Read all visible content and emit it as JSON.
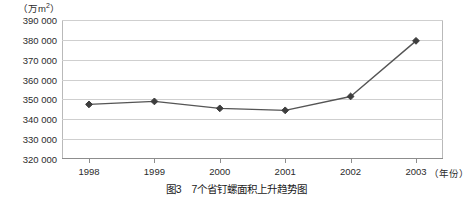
{
  "chart_data": {
    "type": "line",
    "title": "",
    "caption": "图3　7个省钉螺面积上升趋势图",
    "xlabel": "（年份）",
    "ylabel": "（万m²）",
    "categories": [
      "1998",
      "1999",
      "2000",
      "2001",
      "2002",
      "2003"
    ],
    "values": [
      347500,
      349000,
      345500,
      344500,
      351500,
      379500
    ],
    "series": [
      {
        "name": "7个省钉螺面积",
        "values": [
          347500,
          349000,
          345500,
          344500,
          351500,
          379500
        ]
      }
    ],
    "ylim": [
      320000,
      390000
    ],
    "ytick_labels": [
      "390 000",
      "380 000",
      "370 000",
      "360 000",
      "350 000",
      "340 000",
      "330 000",
      "320 000"
    ],
    "ytick_values": [
      390000,
      380000,
      370000,
      360000,
      350000,
      340000,
      330000,
      320000
    ],
    "grid": true,
    "legend": false,
    "legend_position": "none",
    "marker": "diamond",
    "line_color": "#555555",
    "marker_color": "#3d3d3d",
    "grid_color": "#cfcfcf",
    "axis_color": "#8d8d8d"
  },
  "axis": {
    "y_unit_prefix": "（万m",
    "y_unit_sup": "2",
    "y_unit_suffix": "）",
    "x_unit": "（年份）"
  },
  "caption": {
    "text": "图3　7个省钉螺面积上升趋势图"
  }
}
